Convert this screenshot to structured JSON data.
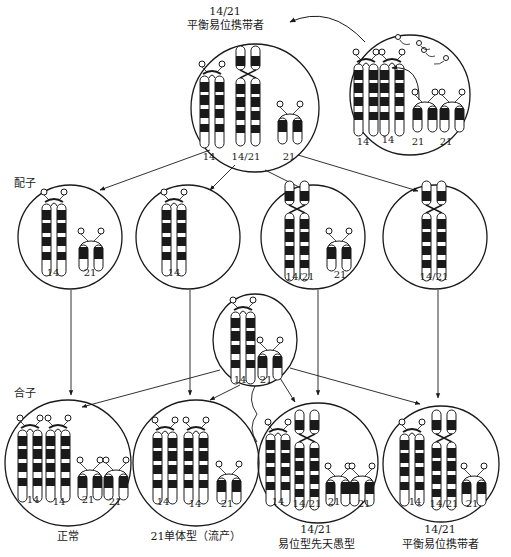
{
  "title": {
    "carrier_karyotype": "14/21",
    "carrier_label": "平衡易位携带者"
  },
  "rows": {
    "gamete_label": "配子",
    "zygote_label": "合子"
  },
  "parent_cells": [
    {
      "chromosomes": [
        "14",
        "14/21",
        "21"
      ]
    },
    {
      "chromosomes": [
        "14",
        "14",
        "21",
        "21"
      ]
    }
  ],
  "gametes": [
    {
      "chromosomes": [
        "14",
        "21"
      ]
    },
    {
      "chromosomes": [
        "14"
      ]
    },
    {
      "chromosomes": [
        "14/21",
        "21"
      ]
    },
    {
      "chromosomes": [
        "14/21"
      ]
    }
  ],
  "normal_partner_gamete": {
    "chromosomes": [
      "14",
      "21"
    ]
  },
  "zygotes": [
    {
      "chromosomes": [
        "14",
        "14",
        "21",
        "21"
      ],
      "karyotype": "",
      "outcome": "正常"
    },
    {
      "chromosomes": [
        "14",
        "14",
        "21"
      ],
      "karyotype": "",
      "outcome": "21单体型（流产）"
    },
    {
      "chromosomes": [
        "14",
        "14/21",
        "21",
        "21"
      ],
      "karyotype": "14/21",
      "outcome": "易位型先天愚型"
    },
    {
      "chromosomes": [
        "14",
        "14/21",
        "21"
      ],
      "karyotype": "14/21",
      "outcome": "平衡易位携带者"
    }
  ],
  "colors": {
    "ink": "#1a1a1a",
    "background": "#ffffff"
  }
}
